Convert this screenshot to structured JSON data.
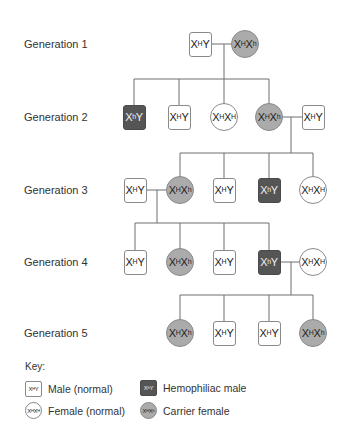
{
  "generations": [
    {
      "label": "Generation 1",
      "y": 44
    },
    {
      "label": "Generation 2",
      "y": 117
    },
    {
      "label": "Generation 3",
      "y": 190
    },
    {
      "label": "Generation 4",
      "y": 262
    },
    {
      "label": "Generation 5",
      "y": 333
    }
  ],
  "individuals": [
    {
      "id": "g1-m",
      "gen": 1,
      "type": "male",
      "x": 200,
      "base1": "X",
      "sup1": "H",
      "base2": "Y",
      "sup2": ""
    },
    {
      "id": "g1-f",
      "gen": 1,
      "type": "carrier",
      "x": 245,
      "base1": "X",
      "sup1": "H",
      "base2": "X",
      "sup2": "h"
    },
    {
      "id": "g2-1",
      "gen": 2,
      "type": "hemo",
      "x": 134,
      "base1": "X",
      "sup1": "h",
      "base2": "Y",
      "sup2": ""
    },
    {
      "id": "g2-2",
      "gen": 2,
      "type": "male",
      "x": 179,
      "base1": "X",
      "sup1": "H",
      "base2": "Y",
      "sup2": ""
    },
    {
      "id": "g2-3",
      "gen": 2,
      "type": "female",
      "x": 224,
      "base1": "X",
      "sup1": "H",
      "base2": "X",
      "sup2": "H"
    },
    {
      "id": "g2-4",
      "gen": 2,
      "type": "carrier",
      "x": 269,
      "base1": "X",
      "sup1": "H",
      "base2": "X",
      "sup2": "h"
    },
    {
      "id": "g2-sp",
      "gen": 2,
      "type": "male",
      "x": 313,
      "base1": "X",
      "sup1": "H",
      "base2": "Y",
      "sup2": ""
    },
    {
      "id": "g3-sp",
      "gen": 3,
      "type": "male",
      "x": 135,
      "base1": "X",
      "sup1": "H",
      "base2": "Y",
      "sup2": ""
    },
    {
      "id": "g3-1",
      "gen": 3,
      "type": "carrier",
      "x": 180,
      "base1": "X",
      "sup1": "H",
      "base2": "X",
      "sup2": "h"
    },
    {
      "id": "g3-2",
      "gen": 3,
      "type": "male",
      "x": 224,
      "base1": "X",
      "sup1": "H",
      "base2": "Y",
      "sup2": ""
    },
    {
      "id": "g3-3",
      "gen": 3,
      "type": "hemo",
      "x": 269,
      "base1": "X",
      "sup1": "h",
      "base2": "Y",
      "sup2": ""
    },
    {
      "id": "g3-4",
      "gen": 3,
      "type": "female",
      "x": 313,
      "base1": "X",
      "sup1": "H",
      "base2": "X",
      "sup2": "H"
    },
    {
      "id": "g4-1",
      "gen": 4,
      "type": "male",
      "x": 135,
      "base1": "X",
      "sup1": "H",
      "base2": "Y",
      "sup2": ""
    },
    {
      "id": "g4-2",
      "gen": 4,
      "type": "carrier",
      "x": 180,
      "base1": "X",
      "sup1": "H",
      "base2": "X",
      "sup2": "h"
    },
    {
      "id": "g4-3",
      "gen": 4,
      "type": "male",
      "x": 224,
      "base1": "X",
      "sup1": "H",
      "base2": "Y",
      "sup2": ""
    },
    {
      "id": "g4-4",
      "gen": 4,
      "type": "hemo",
      "x": 269,
      "base1": "X",
      "sup1": "h",
      "base2": "Y",
      "sup2": ""
    },
    {
      "id": "g4-sp",
      "gen": 4,
      "type": "female",
      "x": 313,
      "base1": "X",
      "sup1": "H",
      "base2": "X",
      "sup2": "H"
    },
    {
      "id": "g5-1",
      "gen": 5,
      "type": "carrier",
      "x": 180,
      "base1": "X",
      "sup1": "H",
      "base2": "X",
      "sup2": "h"
    },
    {
      "id": "g5-2",
      "gen": 5,
      "type": "male",
      "x": 224,
      "base1": "X",
      "sup1": "H",
      "base2": "Y",
      "sup2": ""
    },
    {
      "id": "g5-3",
      "gen": 5,
      "type": "male",
      "x": 269,
      "base1": "X",
      "sup1": "H",
      "base2": "Y",
      "sup2": ""
    },
    {
      "id": "g5-4",
      "gen": 5,
      "type": "carrier",
      "x": 313,
      "base1": "X",
      "sup1": "H",
      "base2": "X",
      "sup2": "h"
    }
  ],
  "families": [
    {
      "parents": [
        "g1-m",
        "g1-f"
      ],
      "mate_y": 44,
      "drop_x": 224,
      "bar_y": 79,
      "children": [
        "g2-1",
        "g2-2",
        "g2-3",
        "g2-4"
      ],
      "child_y": 117
    },
    {
      "parents": [
        "g2-4",
        "g2-sp"
      ],
      "mate_y": 117,
      "drop_x": 291,
      "bar_y": 153,
      "children": [
        "g3-1",
        "g3-2",
        "g3-3",
        "g3-4"
      ],
      "child_y": 190
    },
    {
      "parents": [
        "g3-sp",
        "g3-1"
      ],
      "mate_y": 190,
      "drop_x": 157,
      "bar_y": 223,
      "children": [
        "g4-1",
        "g4-2",
        "g4-3",
        "g4-4"
      ],
      "child_y": 262
    },
    {
      "parents": [
        "g4-4",
        "g4-sp"
      ],
      "mate_y": 262,
      "drop_x": 291,
      "bar_y": 295,
      "children": [
        "g5-1",
        "g5-2",
        "g5-3",
        "g5-4"
      ],
      "child_y": 333
    }
  ],
  "key": {
    "title": "Key:",
    "items": [
      {
        "type": "male",
        "label": "Male (normal)",
        "base1": "X",
        "sup1": "H",
        "base2": "Y",
        "sup2": "",
        "x": 25,
        "y": 381
      },
      {
        "type": "female",
        "label": "Female (normal)",
        "base1": "X",
        "sup1": "H",
        "base2": "X",
        "sup2": "H",
        "x": 25,
        "y": 402
      },
      {
        "type": "hemo",
        "label": "Hemophiliac male",
        "base1": "X",
        "sup1": "h",
        "base2": "Y",
        "sup2": "",
        "x": 140,
        "y": 380
      },
      {
        "type": "carrier",
        "label": "Carrier female",
        "base1": "X",
        "sup1": "H",
        "base2": "X",
        "sup2": "h",
        "x": 140,
        "y": 402
      }
    ]
  },
  "colors": {
    "line": "#6e6e6e",
    "border": "#8a8a8a",
    "hemophiliac_fill": "#555555",
    "carrier_fill": "#ababab",
    "normal_fill": "#ffffff"
  }
}
